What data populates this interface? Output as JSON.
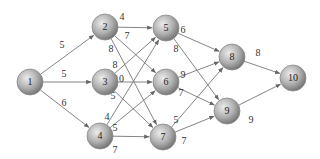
{
  "diagram": {
    "type": "directed-network",
    "nodes": [
      {
        "id": "1",
        "label": "1",
        "x": 30,
        "y": 82
      },
      {
        "id": "2",
        "label": "2",
        "x": 105,
        "y": 27
      },
      {
        "id": "3",
        "label": "3",
        "x": 105,
        "y": 82
      },
      {
        "id": "4",
        "label": "4",
        "x": 100,
        "y": 136
      },
      {
        "id": "5",
        "label": "5",
        "x": 166,
        "y": 28
      },
      {
        "id": "6",
        "label": "6",
        "x": 166,
        "y": 82
      },
      {
        "id": "7",
        "label": "7",
        "x": 163,
        "y": 137
      },
      {
        "id": "8",
        "label": "8",
        "x": 232,
        "y": 57
      },
      {
        "id": "9",
        "label": "9",
        "x": 227,
        "y": 111
      },
      {
        "id": "10",
        "label": "10",
        "x": 293,
        "y": 78
      }
    ],
    "edges": [
      {
        "from": "1",
        "to": "2",
        "weight": "5",
        "lx": 62,
        "ly": 46
      },
      {
        "from": "1",
        "to": "3",
        "weight": "5",
        "lx": 64,
        "ly": 75
      },
      {
        "from": "1",
        "to": "4",
        "weight": "6",
        "lx": 64,
        "ly": 104
      },
      {
        "from": "2",
        "to": "5",
        "weight": "4",
        "lx": 122,
        "ly": 18
      },
      {
        "from": "2",
        "to": "6",
        "weight": "7",
        "lx": 127,
        "ly": 37
      },
      {
        "from": "2",
        "to": "7",
        "weight": "8",
        "lx": 111,
        "ly": 50
      },
      {
        "from": "3",
        "to": "5",
        "weight": "8",
        "lx": 115,
        "ly": 66
      },
      {
        "from": "3",
        "to": "6",
        "weight": "10",
        "lx": 119,
        "ly": 80
      },
      {
        "from": "3",
        "to": "7",
        "weight": "5",
        "lx": 113,
        "ly": 97
      },
      {
        "from": "4",
        "to": "5",
        "weight": "4",
        "lx": 107,
        "ly": 118
      },
      {
        "from": "4",
        "to": "6",
        "weight": "5",
        "lx": 115,
        "ly": 129
      },
      {
        "from": "4",
        "to": "7",
        "weight": "7",
        "lx": 115,
        "ly": 151
      },
      {
        "from": "5",
        "to": "8",
        "weight": "6",
        "lx": 183,
        "ly": 31
      },
      {
        "from": "5",
        "to": "9",
        "weight": "8",
        "lx": 176,
        "ly": 50
      },
      {
        "from": "6",
        "to": "8",
        "weight": "9",
        "lx": 183,
        "ly": 76
      },
      {
        "from": "6",
        "to": "9",
        "weight": "7",
        "lx": 181,
        "ly": 94
      },
      {
        "from": "7",
        "to": "8",
        "weight": "5",
        "lx": 176,
        "ly": 121
      },
      {
        "from": "7",
        "to": "9",
        "weight": "7",
        "lx": 184,
        "ly": 142
      },
      {
        "from": "8",
        "to": "10",
        "weight": "8",
        "lx": 258,
        "ly": 54
      },
      {
        "from": "9",
        "to": "10",
        "weight": "9",
        "lx": 251,
        "ly": 121
      }
    ],
    "colors": {
      "node_fill_light": "#e6e6e6",
      "node_fill_dark": "#7a7a7a",
      "edge": "#777777",
      "background": "#ffffff"
    }
  }
}
